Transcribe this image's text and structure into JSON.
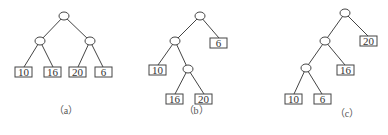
{
  "figures": [
    {
      "id": "a",
      "caption": "（a）",
      "caption_pos": [
        66,
        114
      ],
      "internal_nodes": [
        {
          "x": 64,
          "y": 16
        },
        {
          "x": 40,
          "y": 41
        },
        {
          "x": 90,
          "y": 41
        }
      ],
      "leaves": [
        {
          "value": "10",
          "x": 15,
          "y": 67
        },
        {
          "value": "16",
          "x": 44,
          "y": 67
        },
        {
          "value": "20",
          "x": 69,
          "y": 67
        },
        {
          "value": "6",
          "x": 95,
          "y": 67
        }
      ],
      "edges": [
        [
          64,
          16,
          40,
          41
        ],
        [
          64,
          16,
          90,
          41
        ],
        [
          40,
          41,
          24,
          67
        ],
        [
          40,
          41,
          53,
          67
        ],
        [
          90,
          41,
          78,
          67
        ],
        [
          90,
          41,
          103,
          67
        ]
      ]
    },
    {
      "id": "b",
      "caption": "（b）",
      "caption_pos": [
        196,
        114
      ],
      "internal_nodes": [
        {
          "x": 200,
          "y": 16
        },
        {
          "x": 175,
          "y": 41
        },
        {
          "x": 188,
          "y": 69
        }
      ],
      "leaves": [
        {
          "value": "6",
          "x": 210,
          "y": 38
        },
        {
          "value": "10",
          "x": 149,
          "y": 65
        },
        {
          "value": "16",
          "x": 166,
          "y": 94
        },
        {
          "value": "20",
          "x": 195,
          "y": 94
        }
      ],
      "edges": [
        [
          200,
          16,
          175,
          41
        ],
        [
          200,
          16,
          219,
          38
        ],
        [
          175,
          41,
          158,
          65
        ],
        [
          175,
          41,
          188,
          69
        ],
        [
          188,
          69,
          175,
          94
        ],
        [
          188,
          69,
          204,
          94
        ]
      ]
    },
    {
      "id": "c",
      "caption": "（c）",
      "caption_pos": [
        347,
        117
      ],
      "internal_nodes": [
        {
          "x": 345,
          "y": 13
        },
        {
          "x": 325,
          "y": 41
        },
        {
          "x": 306,
          "y": 68
        }
      ],
      "leaves": [
        {
          "value": "20",
          "x": 360,
          "y": 36
        },
        {
          "value": "16",
          "x": 337,
          "y": 65
        },
        {
          "value": "10",
          "x": 285,
          "y": 94
        },
        {
          "value": "6",
          "x": 314,
          "y": 94
        }
      ],
      "edges": [
        [
          345,
          13,
          325,
          41
        ],
        [
          345,
          13,
          368,
          36
        ],
        [
          325,
          41,
          306,
          68
        ],
        [
          325,
          41,
          345,
          65
        ],
        [
          306,
          68,
          294,
          94
        ],
        [
          306,
          68,
          322,
          94
        ]
      ]
    }
  ],
  "style": {
    "leaf_width": 17,
    "leaf_height": 10,
    "node_rx": 5,
    "node_ry": 4,
    "line_color": "#444444",
    "text_color": "#333333"
  }
}
